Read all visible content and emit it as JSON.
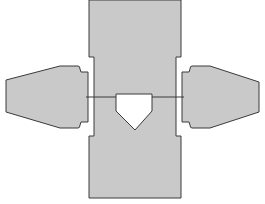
{
  "diagram": {
    "type": "baseball home plate area",
    "colors": {
      "background": "#ffffff",
      "fill": "#c9c9c9",
      "stroke": "#3a3a3a",
      "plate_fill": "#ffffff"
    },
    "elements": [
      {
        "name": "catcher-and-umpire-area",
        "shape": "vertical column"
      },
      {
        "name": "left-batters-box",
        "shape": "tapered box"
      },
      {
        "name": "right-batters-box",
        "shape": "tapered box"
      },
      {
        "name": "home-plate",
        "shape": "pentagon"
      },
      {
        "name": "front-line",
        "shape": "horizontal line"
      }
    ]
  }
}
